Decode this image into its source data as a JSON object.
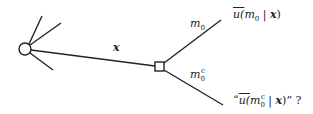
{
  "diagram": {
    "type": "decision-tree",
    "chance_node": {
      "shape": "circle",
      "cx": 25,
      "cy": 49,
      "r": 6
    },
    "decision_node": {
      "shape": "square",
      "x": 155,
      "y": 62,
      "size": 9
    },
    "edges": {
      "observation": {
        "label_var": "x"
      },
      "upper_branch": {
        "label_var": "m",
        "label_sub": "0"
      },
      "lower_branch": {
        "label_var": "m",
        "label_sub": "0",
        "label_sup": "c"
      }
    },
    "outcomes": {
      "upper": {
        "text_open": "u(",
        "var": "m",
        "sub": "0",
        "sep": " | ",
        "given": "x",
        "close": ")"
      },
      "lower": {
        "quote_open": "“",
        "text_open": "u(",
        "var": "m",
        "sub": "0",
        "sup": "c",
        "sep": " | ",
        "given": "x",
        "close": ")",
        "quote_close": "”",
        "suffix": " ?"
      }
    },
    "colors": {
      "stroke": "#222222",
      "background": "#ffffff"
    }
  }
}
